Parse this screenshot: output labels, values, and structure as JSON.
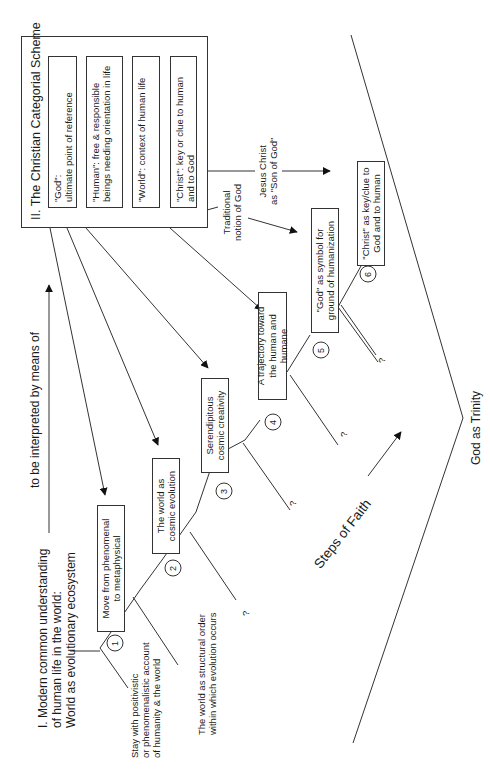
{
  "scheme": {
    "title": "II. The Christian Categorial Scheme",
    "categories": [
      {
        "term": "\"God\":",
        "desc": "ultimate point of reference"
      },
      {
        "term": "\"Human\":",
        "desc": "free & responsible beings needing orientation in life"
      },
      {
        "term": "\"World\":",
        "desc": "context of human life"
      },
      {
        "term": "\"Christ\":",
        "desc": "key or clue to human and to God"
      }
    ]
  },
  "modern": {
    "line1": "I. Modern common understanding",
    "line2": "of human life in the world:",
    "line3": "World as evolutionary ecosystem"
  },
  "interpret_label": "to be interpreted by means of",
  "steps": [
    {
      "num": "1",
      "box_l1": "Move from phenomenal",
      "box_l2": "to metaphysical",
      "alt_l1": "Stay with positivistic",
      "alt_l2": "or phenomenalistic account",
      "alt_l3": "of humanity & the world"
    },
    {
      "num": "2",
      "box_l1": "The world as",
      "box_l2": "cosmic evolution",
      "alt_l1": "The world as structural order",
      "alt_l2": "within which evolution occurs"
    },
    {
      "num": "3",
      "box_l1": "Serendipitous",
      "box_l2": "cosmic creativity",
      "alt_l1": "?"
    },
    {
      "num": "4",
      "box_l1": "A trajectory toward",
      "box_l2": "the human and humane",
      "alt_l1": "?"
    },
    {
      "num": "5",
      "box_l1": "\"God\" as symbol for",
      "box_l2": "ground of humanization",
      "alt_l1": "?"
    },
    {
      "num": "6",
      "box_l1": "\"Christ\" as key/clue to",
      "box_l2": "God and to human",
      "alt_l1": "?"
    }
  ],
  "traditional_label": {
    "l1": "Traditional",
    "l2": "notion of God"
  },
  "jesus_label": {
    "l1": "Jesus Christ",
    "l2": "as \"Son of God\""
  },
  "steps_of_faith": "Steps of Faith",
  "god_as_trinity": "God as Trinity",
  "colors": {
    "line": "#333333",
    "background": "#ffffff",
    "text": "#1a1a1a"
  }
}
